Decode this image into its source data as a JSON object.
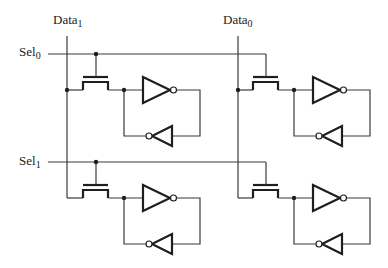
{
  "diagram": {
    "title": "",
    "type": "SRAM cell array 2x2 (pass transistor + cross-coupled inverters)",
    "labels": {
      "data1": {
        "text": "Data",
        "sub": "1",
        "x": 53,
        "y": 13
      },
      "data0": {
        "text": "Data",
        "sub": "0",
        "x": 223,
        "y": 13
      },
      "sel0": {
        "text": "Sel",
        "sub": "0",
        "x": 19,
        "y": 45
      },
      "sel1": {
        "text": "Sel",
        "sub": "1",
        "x": 19,
        "y": 154
      }
    },
    "colors": {
      "wire": "#3a3a3a",
      "component": "#1e1e1e",
      "background": "#ffffff"
    },
    "bit_lines": [
      {
        "name": "Data1",
        "x": 67,
        "y1": 36,
        "y2": 198
      },
      {
        "name": "Data0",
        "x": 238,
        "y1": 36,
        "y2": 198
      }
    ],
    "select_lines": [
      {
        "name": "Sel0",
        "y": 54,
        "x1": 48,
        "x2": 266
      },
      {
        "name": "Sel1",
        "y": 162,
        "x1": 48,
        "x2": 266
      }
    ],
    "cells": [
      {
        "id": "cell-r0-c1",
        "row": 0,
        "col": "Data1",
        "data_x": 67,
        "sel_y": 54,
        "node_y": 90,
        "gate_x": 96,
        "data_junction": true,
        "gate_junction": true
      },
      {
        "id": "cell-r0-c0",
        "row": 0,
        "col": "Data0",
        "data_x": 238,
        "sel_y": 54,
        "node_y": 90,
        "gate_x": 266,
        "data_junction": true,
        "gate_junction": false
      },
      {
        "id": "cell-r1-c1",
        "row": 1,
        "col": "Data1",
        "data_x": 67,
        "sel_y": 162,
        "node_y": 198,
        "gate_x": 96,
        "data_junction": false,
        "gate_junction": true
      },
      {
        "id": "cell-r1-c0",
        "row": 1,
        "col": "Data0",
        "data_x": 238,
        "sel_y": 162,
        "node_y": 198,
        "gate_x": 266,
        "data_junction": false,
        "gate_junction": false
      }
    ]
  }
}
